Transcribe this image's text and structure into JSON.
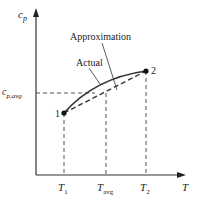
{
  "diagram": {
    "y_axis_label": {
      "base": "c",
      "sub": "p"
    },
    "x_axis_label": "T",
    "avg_label": {
      "base": "c",
      "sub": "p,avg"
    },
    "curve_labels": {
      "approximation": "Approximation",
      "actual": "Actual"
    },
    "points": [
      {
        "label": "1",
        "x": 64,
        "y": 113
      },
      {
        "label": "2",
        "x": 146,
        "y": 71
      }
    ],
    "x_ticks": [
      {
        "base": "T",
        "sub": "1"
      },
      {
        "base": "T",
        "sub": "avg"
      },
      {
        "base": "T",
        "sub": "2"
      }
    ],
    "colors": {
      "line": "#333333",
      "dash": "#555555",
      "point": "#111111"
    }
  }
}
